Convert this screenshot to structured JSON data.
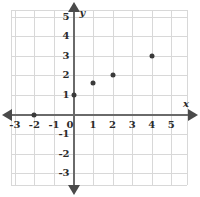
{
  "chart_data": {
    "type": "scatter",
    "title": "",
    "subtitle": "",
    "xlabel": "x",
    "ylabel": "y",
    "xlim": [
      -3.6,
      5.9
    ],
    "ylim": [
      -3.6,
      5.6
    ],
    "grid": true,
    "legend": null,
    "x_ticks": [
      -3,
      -2,
      -1,
      0,
      1,
      2,
      3,
      4,
      5
    ],
    "y_ticks": [
      5,
      4,
      3,
      2,
      1,
      0,
      -1,
      -2,
      -3
    ],
    "x_tick_labels": [
      "-3",
      "-2",
      "-1",
      "0",
      "1",
      "2",
      "3",
      "4",
      "5"
    ],
    "y_tick_labels": [
      "5",
      "4",
      "3",
      "2",
      "1",
      "0",
      "-1",
      "-2",
      "-3"
    ],
    "points": [
      {
        "x": -2,
        "y": 0,
        "label": "(-2, 0)"
      },
      {
        "x": 0,
        "y": 1,
        "label": "(0, 1)"
      },
      {
        "x": 1,
        "y": 1.6,
        "label": "(1, 1.6)"
      },
      {
        "x": 2,
        "y": 2,
        "label": "(2, 2)"
      },
      {
        "x": 4,
        "y": 3,
        "label": "(4, 3)"
      }
    ],
    "point_color": "#3a3a3a",
    "grid_color": "#d8d8d8",
    "axis_color": "#6a6a6a",
    "background_color": "#ffffff"
  }
}
